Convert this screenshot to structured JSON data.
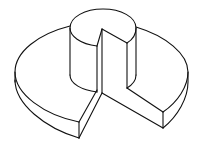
{
  "figure": {
    "description": "Isometric line drawing of a cut-away stepped disk: a large flat disk with a wedge sector removed, and a smaller raised cylinder on top also with a wedge notch",
    "colors": {
      "background": "#ffffff",
      "stroke": "#111111"
    },
    "parts": [
      {
        "name": "base-disk",
        "label": "Large disk with wedge removed"
      },
      {
        "name": "top-cylinder",
        "label": "Raised cylinder with wedge notch"
      },
      {
        "name": "wedge-cut",
        "label": "Removed sector exposing interior faces"
      }
    ]
  }
}
